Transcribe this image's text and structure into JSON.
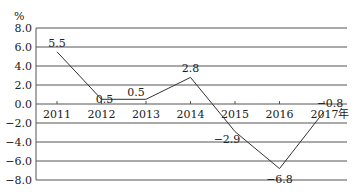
{
  "chart_data": {
    "type": "line",
    "title": "",
    "ylabel": "%",
    "xlabel": "",
    "x_suffix": "年",
    "categories": [
      "2011",
      "2012",
      "2013",
      "2014",
      "2015",
      "2016",
      "2017"
    ],
    "series": [
      {
        "name": "",
        "values": [
          5.5,
          0.5,
          0.5,
          2.8,
          -2.9,
          -6.8,
          -0.8
        ]
      }
    ],
    "data_labels": [
      "5.5",
      "0.5",
      "0.5",
      "2.8",
      "−2.9",
      "−6.8",
      "−0.8"
    ],
    "y_ticks": [
      "8.0",
      "6.0",
      "4.0",
      "2.0",
      "0.0",
      "−2.0",
      "−4.0",
      "−6.0",
      "−8.0"
    ],
    "y_tick_values": [
      8,
      6,
      4,
      2,
      0,
      -2,
      -4,
      -6,
      -8
    ],
    "ylim": [
      -8,
      8
    ],
    "grid": true,
    "legend": "none",
    "colors": {
      "line": "#333333",
      "grid": "#555555",
      "text": "#222222"
    }
  }
}
